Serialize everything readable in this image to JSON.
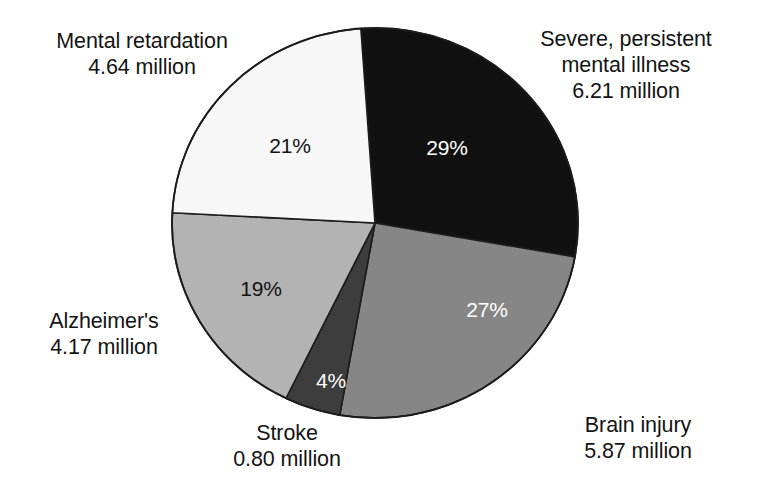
{
  "chart_data": {
    "type": "pie",
    "title": "",
    "subtitle": "",
    "xlabel": "",
    "ylabel": "",
    "legend_position": "callout-labels",
    "grid": false,
    "units": "million people",
    "categories": [
      "Severe, persistent mental illness",
      "Brain injury",
      "Stroke",
      "Alzheimer's",
      "Mental retardation"
    ],
    "values": [
      6.21,
      5.87,
      0.8,
      4.17,
      4.64
    ],
    "percents": [
      29,
      27,
      4,
      19,
      21
    ],
    "total": 21.69,
    "slices": [
      {
        "id": "severe-mental-illness",
        "label_lines": [
          "Severe, persistent",
          "mental illness",
          "6.21 million"
        ],
        "name": "Severe, persistent mental illness",
        "value": 6.21,
        "value_text": "6.21 million",
        "percent": 29,
        "percent_text": "29%",
        "color": "#111111",
        "label_text_color": "#ffffff",
        "start_angle": 356,
        "end_angle": 460
      },
      {
        "id": "brain-injury",
        "label_lines": [
          "Brain injury",
          "5.87 million"
        ],
        "name": "Brain injury",
        "value": 5.87,
        "value_text": "5.87 million",
        "percent": 27,
        "percent_text": "27%",
        "color": "#868686",
        "label_text_color": "#ffffff",
        "start_angle": 100,
        "end_angle": 190
      },
      {
        "id": "stroke",
        "label_lines": [
          "Stroke",
          "0.80 million"
        ],
        "name": "Stroke",
        "value": 0.8,
        "value_text": "0.80 million",
        "percent": 4,
        "percent_text": "4%",
        "color": "#3d3d3d",
        "label_text_color": "#ffffff",
        "start_angle": 190,
        "end_angle": 206
      },
      {
        "id": "alzheimers",
        "label_lines": [
          "Alzheimer's",
          "4.17 million"
        ],
        "name": "Alzheimer's",
        "value": 4.17,
        "value_text": "4.17 million",
        "percent": 19,
        "percent_text": "19%",
        "color": "#b3b3b3",
        "label_text_color": "#121212",
        "start_angle": 206,
        "end_angle": 273
      },
      {
        "id": "mental-retardation",
        "label_lines": [
          "Mental retardation",
          "4.64 million"
        ],
        "name": "Mental retardation",
        "value": 4.64,
        "value_text": "4.64 million",
        "percent": 21,
        "percent_text": "21%",
        "color": "#f7f7f7",
        "label_text_color": "#121212",
        "start_angle": 273,
        "end_angle": 356
      }
    ]
  },
  "callouts": {
    "mental_retardation": {
      "line1": "Mental retardation",
      "line2": "4.64 million"
    },
    "severe_mental_illness": {
      "line1": "Severe, persistent",
      "line2": "mental illness",
      "line3": "6.21 million"
    },
    "alzheimers": {
      "line1": "Alzheimer's",
      "line2": "4.17 million"
    },
    "stroke": {
      "line1": "Stroke",
      "line2": "0.80 million"
    },
    "brain_injury": {
      "line1": "Brain injury",
      "line2": "5.87 million"
    }
  },
  "slice_percent_labels": {
    "severe_mental_illness": "29%",
    "brain_injury": "27%",
    "stroke": "4%",
    "alzheimers": "19%",
    "mental_retardation": "21%"
  },
  "colors": {
    "severe_mental_illness": "#111111",
    "brain_injury": "#868686",
    "stroke": "#3d3d3d",
    "alzheimers": "#b3b3b3",
    "mental_retardation": "#f7f7f7",
    "outline": "#1c1c1c",
    "background": "#ffffff",
    "text": "#141414"
  },
  "geometry": {
    "center_x": 375,
    "center_y": 223,
    "radius_x": 203,
    "radius_y": 195
  }
}
